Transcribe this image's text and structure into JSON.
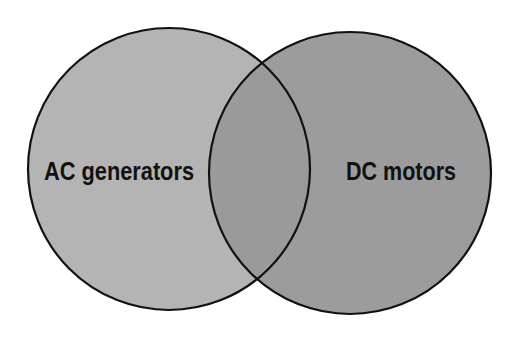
{
  "diagram": {
    "type": "venn",
    "sets": [
      {
        "label": "AC generators",
        "cx": 169,
        "cy": 169,
        "r": 141,
        "fill": "#b4b4b4"
      },
      {
        "label": "DC motors",
        "cx": 350,
        "cy": 173,
        "r": 141,
        "fill": "#9c9c9c"
      }
    ],
    "overlap_fill": "#9a9a9a",
    "stroke": "#111111"
  }
}
